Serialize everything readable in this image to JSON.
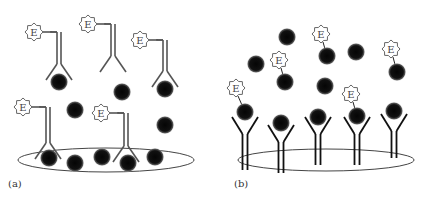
{
  "figure": {
    "panels": [
      {
        "id": "a",
        "label": "(a)",
        "description": "Competitive / sandwich assay in solution: enzyme-labelled antibodies bind free antigens; surface ellipse holds antigens",
        "enzyme_label": "E",
        "antibodies": [
          {
            "x": 59,
            "y_top": 32,
            "y_fork": 64,
            "bound": true,
            "enzyme": true
          },
          {
            "x": 113,
            "y_top": 24,
            "y_fork": 56,
            "bound": false,
            "enzyme": true
          },
          {
            "x": 165,
            "y_top": 40,
            "y_fork": 71,
            "bound": true,
            "enzyme": true
          },
          {
            "x": 48,
            "y_top": 107,
            "y_fork": 143,
            "bound": true,
            "enzyme": true
          },
          {
            "x": 126,
            "y_top": 113,
            "y_fork": 146,
            "bound": true,
            "enzyme": true
          }
        ],
        "free_antigens": [
          [
            75,
            110
          ],
          [
            122,
            92
          ],
          [
            165,
            125
          ]
        ],
        "surface_antigens": [
          [
            49,
            158
          ],
          [
            75,
            163
          ],
          [
            102,
            157
          ],
          [
            128,
            163
          ],
          [
            155,
            157
          ]
        ],
        "surface": {
          "cx": 106,
          "cy": 160,
          "rx": 88,
          "ry": 12
        }
      },
      {
        "id": "b",
        "label": "(b)",
        "description": "Surface-immobilized capture antibodies bind antigens; some antigens carry enzyme labels",
        "enzyme_label": "E",
        "capture_antibodies": [
          {
            "x": 245,
            "y_fork": 134,
            "y_bottom": 170
          },
          {
            "x": 281,
            "y_fork": 142,
            "y_bottom": 173
          },
          {
            "x": 318,
            "y_fork": 134,
            "y_bottom": 165
          },
          {
            "x": 357,
            "y_fork": 134,
            "y_bottom": 165
          },
          {
            "x": 394,
            "y_fork": 131,
            "y_bottom": 158
          }
        ],
        "bound_antigens": [
          {
            "x": 245,
            "y": 112,
            "enzyme": true
          },
          {
            "x": 281,
            "y": 123,
            "enzyme": false
          },
          {
            "x": 318,
            "y": 117,
            "enzyme": false
          },
          {
            "x": 357,
            "y": 116,
            "enzyme": true
          },
          {
            "x": 394,
            "y": 111,
            "enzyme": false
          }
        ],
        "free_antigens": [
          {
            "x": 287,
            "y": 37,
            "enzyme": false
          },
          {
            "x": 256,
            "y": 64,
            "enzyme": false
          },
          {
            "x": 285,
            "y": 82,
            "enzyme": true
          },
          {
            "x": 327,
            "y": 56,
            "enzyme": true
          },
          {
            "x": 356,
            "y": 52,
            "enzyme": false
          },
          {
            "x": 325,
            "y": 86,
            "enzyme": false
          },
          {
            "x": 397,
            "y": 72,
            "enzyme": true
          }
        ],
        "enzyme_tags": [
          {
            "x": 236,
            "y": 88,
            "target": [
              245,
              112
            ]
          },
          {
            "x": 279,
            "y": 60,
            "target": [
              285,
              82
            ]
          },
          {
            "x": 321,
            "y": 34,
            "target": [
              327,
              56
            ]
          },
          {
            "x": 391,
            "y": 49,
            "target": [
              397,
              72
            ]
          },
          {
            "x": 351,
            "y": 94,
            "target": [
              357,
              116
            ]
          }
        ],
        "surface": {
          "cx": 326,
          "cy": 160,
          "rx": 88,
          "ry": 11
        }
      }
    ]
  }
}
